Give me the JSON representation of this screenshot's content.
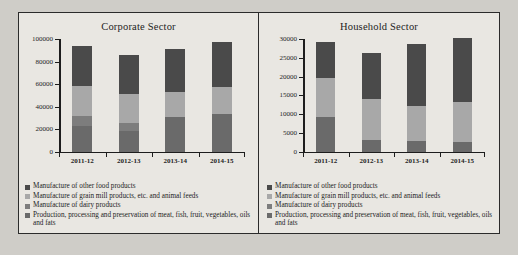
{
  "figure": {
    "background_color": "#cfcdc8",
    "panel_color": "#e9e7e2",
    "frame_color": "#2b2b2b"
  },
  "series_colors": {
    "other_food": "#4a4a4a",
    "grain_mill": "#a8a8a8",
    "dairy": "#7d7d7d",
    "meat_fish": "#6a6a6a"
  },
  "legend": {
    "items": [
      {
        "label": "Manufacture of other food products",
        "color": "#4a4a4a",
        "key": "other_food"
      },
      {
        "label": "Manufacture of grain mill products, etc. and animal feeds",
        "color": "#a8a8a8",
        "key": "grain_mill"
      },
      {
        "label": "Manufacture of dairy products",
        "color": "#7d7d7d",
        "key": "dairy"
      },
      {
        "label": "Production, processing and preservation of meat, fish, fruit, vegetables, oils and fats",
        "color": "#6a6a6a",
        "key": "meat_fish"
      }
    ]
  },
  "chart_data": [
    {
      "type": "bar",
      "stacked": true,
      "title": "Corporate Sector",
      "xlabel": "",
      "ylabel": "",
      "categories": [
        "2011-12",
        "2012-13",
        "2013-14",
        "2014-15"
      ],
      "ylim": [
        0,
        100000
      ],
      "yticks": [
        0,
        20000,
        40000,
        60000,
        80000,
        100000
      ],
      "ytick_labels": [
        "0",
        "20000",
        "40000",
        "60000",
        "80000",
        "100000"
      ],
      "grid": false,
      "legend_position": "below-plot",
      "series": [
        {
          "name": "Production, processing and preservation of meat, fish, fruit, vegetables, oils and fats",
          "color": "#6a6a6a",
          "values": [
            22500,
            18000,
            30500,
            33000
          ]
        },
        {
          "name": "Manufacture of dairy products",
          "color": "#7d7d7d",
          "values": [
            9000,
            7500,
            300,
            300
          ]
        },
        {
          "name": "Manufacture of grain mill products, etc. and animal feeds",
          "color": "#a8a8a8",
          "values": [
            26500,
            25500,
            21700,
            23700
          ]
        },
        {
          "name": "Manufacture of other food products",
          "color": "#4a4a4a",
          "values": [
            35500,
            34500,
            38500,
            40500
          ]
        }
      ],
      "totals": [
        93500,
        85500,
        91000,
        97500
      ]
    },
    {
      "type": "bar",
      "stacked": true,
      "title": "Household Sector",
      "xlabel": "",
      "ylabel": "",
      "categories": [
        "2011-12",
        "2012-13",
        "2013-14",
        "2014-15"
      ],
      "ylim": [
        0,
        30000
      ],
      "yticks": [
        0,
        5000,
        10000,
        15000,
        20000,
        25000,
        30000
      ],
      "ytick_labels": [
        "0",
        "5000",
        "10000",
        "15000",
        "20000",
        "25000",
        "30000"
      ],
      "grid": false,
      "legend_position": "below-plot",
      "series": [
        {
          "name": "Production, processing and preservation of meat, fish, fruit, vegetables, oils and fats",
          "color": "#6a6a6a",
          "values": [
            9100,
            3000,
            2700,
            2500
          ]
        },
        {
          "name": "Manufacture of dairy products",
          "color": "#7d7d7d",
          "values": [
            0,
            0,
            0,
            0
          ]
        },
        {
          "name": "Manufacture of grain mill products, etc. and animal feeds",
          "color": "#a8a8a8",
          "values": [
            10500,
            10900,
            9400,
            10600
          ]
        },
        {
          "name": "Manufacture of other food products",
          "color": "#4a4a4a",
          "values": [
            9500,
            12300,
            16600,
            17200
          ]
        }
      ],
      "totals": [
        29100,
        26200,
        28700,
        30300
      ]
    }
  ]
}
